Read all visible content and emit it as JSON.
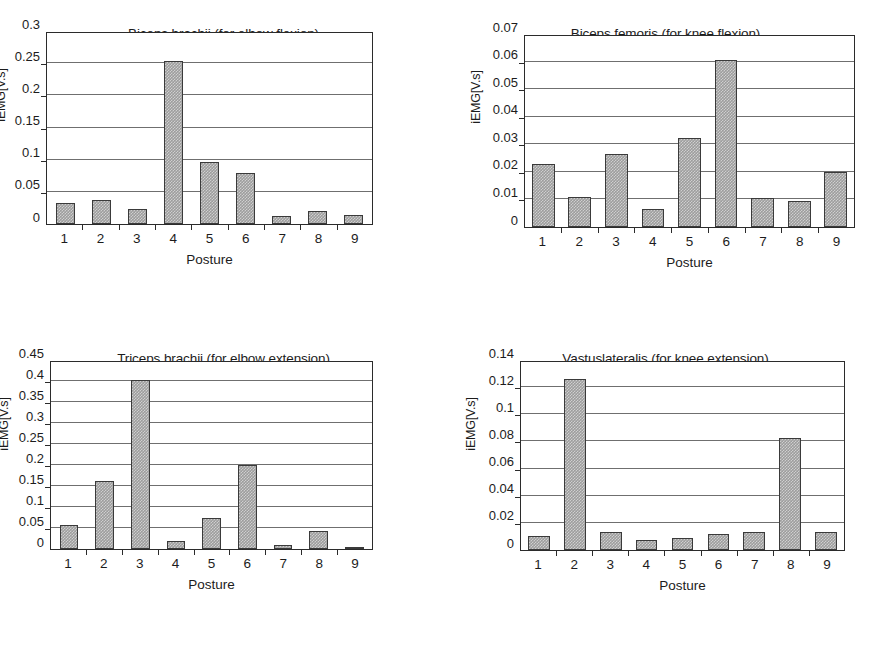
{
  "figure": {
    "background": "#ffffff",
    "bar_color": "#9d9d9d",
    "bar_border_color": "#3a3a3a",
    "axis_color": "#2b2b2b",
    "gridline_color": "#6f6f6f"
  },
  "chart_data": [
    {
      "type": "bar",
      "title": "Biceps brachii (for elbow flexion)",
      "xlabel": "Posture",
      "ylabel": "iEMG[V.s]",
      "categories": [
        "1",
        "2",
        "3",
        "4",
        "5",
        "6",
        "7",
        "8",
        "9"
      ],
      "values": [
        0.032,
        0.037,
        0.024,
        0.254,
        0.096,
        0.079,
        0.012,
        0.02,
        0.014
      ],
      "ylim": [
        0,
        0.3
      ],
      "yticks": [
        "0",
        "0.05",
        "0.1",
        "0.15",
        "0.2",
        "0.25",
        "0.3"
      ],
      "ytick_values": [
        0,
        0.05,
        0.1,
        0.15,
        0.2,
        0.25,
        0.3
      ],
      "grid": true,
      "legend": "none",
      "bar_width_ratio": 0.52
    },
    {
      "type": "bar",
      "title": "Biceps femoris (for knee flexion)",
      "xlabel": "Posture",
      "ylabel": "iEMG[V.s]",
      "categories": [
        "1",
        "2",
        "3",
        "4",
        "5",
        "6",
        "7",
        "8",
        "9"
      ],
      "values": [
        0.0228,
        0.011,
        0.0265,
        0.0065,
        0.0323,
        0.0607,
        0.0107,
        0.0094,
        0.0199
      ],
      "ylim": [
        0,
        0.07
      ],
      "yticks": [
        "0",
        "0.01",
        "0.02",
        "0.03",
        "0.04",
        "0.05",
        "0.06",
        "0.07"
      ],
      "ytick_values": [
        0,
        0.01,
        0.02,
        0.03,
        0.04,
        0.05,
        0.06,
        0.07
      ],
      "grid": true,
      "legend": "none",
      "bar_width_ratio": 0.62
    },
    {
      "type": "bar",
      "title": "Triceps brachii (for elbow extension)",
      "xlabel": "Posture",
      "ylabel": "iEMG[V.s]",
      "categories": [
        "1",
        "2",
        "3",
        "4",
        "5",
        "6",
        "7",
        "8",
        "9"
      ],
      "values": [
        0.056,
        0.162,
        0.403,
        0.019,
        0.075,
        0.2,
        0.01,
        0.044,
        0.004
      ],
      "ylim": [
        0,
        0.45
      ],
      "yticks": [
        "0",
        "0.05",
        "0.1",
        "0.15",
        "0.2",
        "0.25",
        "0.3",
        "0.35",
        "0.4",
        "0.45"
      ],
      "ytick_values": [
        0,
        0.05,
        0.1,
        0.15,
        0.2,
        0.25,
        0.3,
        0.35,
        0.4,
        0.45
      ],
      "grid": true,
      "legend": "none",
      "bar_width_ratio": 0.52
    },
    {
      "type": "bar",
      "title": "Vastuslateralis (for knee extension)",
      "xlabel": "Posture",
      "ylabel": "iEMG[V.s]",
      "categories": [
        "1",
        "2",
        "3",
        "4",
        "5",
        "6",
        "7",
        "8",
        "9"
      ],
      "values": [
        0.0102,
        0.1257,
        0.013,
        0.0077,
        0.0085,
        0.012,
        0.0133,
        0.0824,
        0.0131
      ],
      "ylim": [
        0,
        0.14
      ],
      "yticks": [
        "0",
        "0.02",
        "0.04",
        "0.06",
        "0.08",
        "0.1",
        "0.12",
        "0.14"
      ],
      "ytick_values": [
        0,
        0.02,
        0.04,
        0.06,
        0.08,
        0.1,
        0.12,
        0.14
      ],
      "grid": true,
      "legend": "none",
      "bar_width_ratio": 0.6
    }
  ]
}
